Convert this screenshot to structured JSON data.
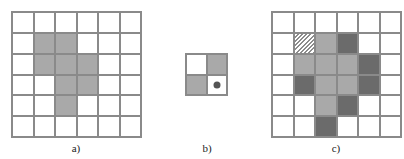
{
  "panels": [
    {
      "id": "a",
      "label": "a)",
      "rows": 6,
      "cols": 6,
      "cells": [
        [
          "w",
          "w",
          "w",
          "w",
          "w",
          "w"
        ],
        [
          "w",
          "l",
          "l",
          "w",
          "w",
          "w"
        ],
        [
          "w",
          "l",
          "l",
          "l",
          "w",
          "w"
        ],
        [
          "w",
          "w",
          "l",
          "l",
          "w",
          "w"
        ],
        [
          "w",
          "w",
          "l",
          "w",
          "w",
          "w"
        ],
        [
          "w",
          "w",
          "w",
          "w",
          "w",
          "w"
        ]
      ]
    },
    {
      "id": "b",
      "label": "b)",
      "rows": 2,
      "cols": 2,
      "cells": [
        [
          "w",
          "l"
        ],
        [
          "l",
          "dot"
        ]
      ]
    },
    {
      "id": "c",
      "label": "c)",
      "rows": 6,
      "cols": 6,
      "cells": [
        [
          "w",
          "w",
          "w",
          "w",
          "w",
          "w"
        ],
        [
          "w",
          "h",
          "l",
          "d",
          "w",
          "w"
        ],
        [
          "w",
          "l",
          "l",
          "l",
          "d",
          "w"
        ],
        [
          "w",
          "d",
          "l",
          "l",
          "d",
          "w"
        ],
        [
          "w",
          "w",
          "l",
          "d",
          "w",
          "w"
        ],
        [
          "w",
          "w",
          "d",
          "w",
          "w",
          "w"
        ]
      ]
    }
  ],
  "legend": {
    "w": "empty",
    "l": "light-gray",
    "d": "dark-gray",
    "h": "hatched",
    "dot": "origin-dot"
  },
  "colors": {
    "grid_line": "#8a8a8a",
    "light": "#a9a9a9",
    "dark": "#6b6b6b"
  }
}
